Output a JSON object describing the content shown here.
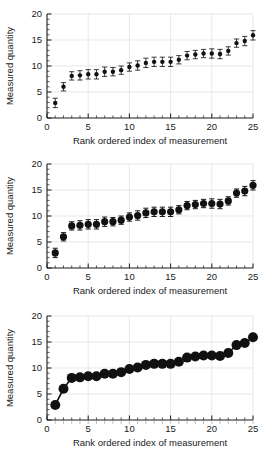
{
  "figure": {
    "title": "",
    "panel_count": 3,
    "background": "#ffffff",
    "marker_color": "#111111"
  },
  "axes": {
    "xlabel": "Rank ordered index of measurement",
    "ylabel": "Measured quantity",
    "xlim": [
      0,
      25
    ],
    "ylim": [
      0,
      20
    ],
    "xticks": [
      0,
      5,
      10,
      15,
      20,
      25
    ],
    "xticklabels": [
      "0",
      "5",
      "10",
      "15",
      "20",
      "25"
    ],
    "yticks": [
      0,
      5,
      10,
      15,
      20
    ],
    "yticklabels": [
      "0",
      "5",
      "10",
      "15",
      "20"
    ],
    "x_minor_step": 1,
    "y_minor_step": 1,
    "grid": "faint major gridlines"
  },
  "chart_data": [
    {
      "type": "scatter",
      "title": "",
      "subtitle": "Panel A - small markers with error bars",
      "xlabel": "Rank ordered index of measurement",
      "ylabel": "Measured quantity",
      "xlim": [
        0,
        25
      ],
      "ylim": [
        0,
        20
      ],
      "grid": true,
      "legend": "none",
      "marker_size": 2.2,
      "errorbars": true,
      "x": [
        1,
        2,
        3,
        4,
        5,
        6,
        7,
        8,
        9,
        10,
        11,
        12,
        13,
        14,
        15,
        16,
        17,
        18,
        19,
        20,
        21,
        22,
        23,
        24,
        25
      ],
      "values": [
        2.9,
        6.0,
        8.1,
        8.2,
        8.4,
        8.4,
        8.9,
        8.9,
        9.2,
        9.8,
        10.1,
        10.6,
        10.8,
        10.8,
        10.8,
        11.2,
        12.0,
        12.2,
        12.4,
        12.4,
        12.3,
        12.9,
        14.4,
        14.8,
        15.9
      ],
      "yerr": [
        0.9,
        0.8,
        0.8,
        0.9,
        0.9,
        0.9,
        0.9,
        0.8,
        0.8,
        0.8,
        0.9,
        0.9,
        0.9,
        0.9,
        0.9,
        0.8,
        0.8,
        0.8,
        0.8,
        0.9,
        0.9,
        0.8,
        0.8,
        0.9,
        0.9
      ]
    },
    {
      "type": "scatter",
      "title": "",
      "subtitle": "Panel B - large markers with error bars",
      "xlabel": "Rank ordered index of measurement",
      "ylabel": "Measured quantity",
      "xlim": [
        0,
        25
      ],
      "ylim": [
        0,
        20
      ],
      "grid": true,
      "legend": "none",
      "marker_size": 3.6,
      "errorbars": true,
      "x": [
        1,
        2,
        3,
        4,
        5,
        6,
        7,
        8,
        9,
        10,
        11,
        12,
        13,
        14,
        15,
        16,
        17,
        18,
        19,
        20,
        21,
        22,
        23,
        24,
        25
      ],
      "values": [
        2.9,
        6.0,
        8.1,
        8.2,
        8.4,
        8.4,
        8.9,
        8.9,
        9.2,
        9.8,
        10.1,
        10.6,
        10.8,
        10.8,
        10.8,
        11.2,
        12.0,
        12.2,
        12.4,
        12.4,
        12.3,
        12.9,
        14.4,
        14.8,
        15.9
      ],
      "yerr": [
        0.9,
        0.8,
        0.8,
        0.9,
        0.9,
        0.9,
        0.9,
        0.8,
        0.8,
        0.8,
        0.9,
        0.9,
        0.9,
        0.9,
        0.9,
        0.8,
        0.8,
        0.8,
        0.8,
        0.9,
        0.9,
        0.8,
        0.8,
        0.9,
        0.9
      ]
    },
    {
      "type": "line",
      "title": "",
      "subtitle": "Panel C - very large filled markers joined by a line",
      "xlabel": "Rank ordered index of measurement",
      "ylabel": "Measured quantity",
      "xlim": [
        0,
        25
      ],
      "ylim": [
        0,
        20
      ],
      "grid": true,
      "legend": "none",
      "marker_size": 5.0,
      "errorbars": false,
      "x": [
        1,
        2,
        3,
        4,
        5,
        6,
        7,
        8,
        9,
        10,
        11,
        12,
        13,
        14,
        15,
        16,
        17,
        18,
        19,
        20,
        21,
        22,
        23,
        24,
        25
      ],
      "values": [
        2.9,
        6.0,
        8.1,
        8.2,
        8.4,
        8.4,
        8.9,
        8.9,
        9.2,
        9.8,
        10.1,
        10.6,
        10.8,
        10.8,
        10.8,
        11.2,
        12.0,
        12.2,
        12.4,
        12.4,
        12.3,
        12.9,
        14.4,
        14.8,
        15.9
      ]
    }
  ]
}
